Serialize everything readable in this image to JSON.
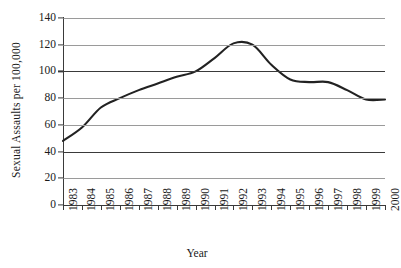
{
  "chart_data": {
    "type": "line",
    "title": "",
    "xlabel": "Year",
    "ylabel": "Sexual Assaults per 100,000",
    "x": [
      1983,
      1984,
      1985,
      1986,
      1987,
      1988,
      1989,
      1990,
      1991,
      1992,
      1993,
      1994,
      1995,
      1996,
      1997,
      1998,
      1999,
      2000
    ],
    "categories": [
      "1983",
      "1984",
      "1985",
      "1986",
      "1987",
      "1988",
      "1989",
      "1990",
      "1991",
      "1992",
      "1993",
      "1994",
      "1995",
      "1996",
      "1997",
      "1998",
      "1999",
      "2000"
    ],
    "values": [
      48,
      58,
      73,
      80,
      86,
      91,
      96,
      100,
      110,
      121,
      120,
      105,
      94,
      92,
      92,
      86,
      79,
      79
    ],
    "series": [
      {
        "name": "Sexual Assaults per 100,000",
        "values": [
          48,
          58,
          73,
          80,
          86,
          91,
          96,
          100,
          110,
          121,
          120,
          105,
          94,
          92,
          92,
          86,
          79,
          79
        ]
      }
    ],
    "ylim": [
      0,
      140
    ],
    "yticks": [
      0,
      20,
      40,
      60,
      80,
      100,
      120,
      140
    ],
    "ytick_labels": [
      "0",
      "20",
      "40",
      "60",
      "80",
      "100",
      "120",
      "140"
    ],
    "xlim": [
      1983,
      2000
    ],
    "grid": "horizontal",
    "legend": "none",
    "line_color": "#222222",
    "gridline_color": "#9a9a9a",
    "axis_color": "#3a3a3a",
    "background_color": "#ffffff"
  }
}
